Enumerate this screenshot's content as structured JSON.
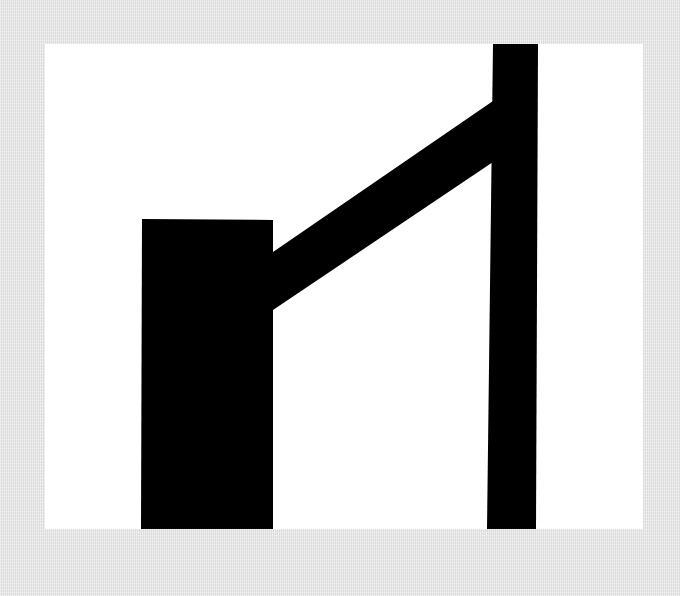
{
  "canvas": {
    "width": 680,
    "height": 596,
    "background_color": "#e6e6e6"
  },
  "card": {
    "color": "#ffffff",
    "x": 45,
    "y": 44,
    "width": 598,
    "height": 485
  },
  "pictogram": {
    "name": "barrier-gate-symbol",
    "color": "#000000",
    "post_block": {
      "points": "142,219 273,220 273,529 141,529"
    },
    "arm": {
      "points": "273,252 493,101 493,162 273,310"
    },
    "pole": {
      "points": "493,44 538,44 536,529 487,529"
    }
  }
}
